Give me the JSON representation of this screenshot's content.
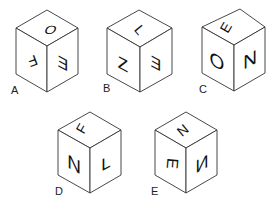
{
  "cubes": [
    {
      "label": "A",
      "faces": {
        "top": "O",
        "left": "F",
        "right": "E"
      },
      "notes": {
        "top": "upright",
        "left": "rotated ~180 (upside-down)",
        "right": "mirrored"
      }
    },
    {
      "label": "B",
      "faces": {
        "top": "L",
        "left": "Z",
        "right": "E"
      },
      "notes": {
        "top": "rotated",
        "left": "upright",
        "right": "mirrored"
      }
    },
    {
      "label": "C",
      "faces": {
        "top": "E",
        "left": "O",
        "right": "N"
      },
      "notes": {
        "top": "rotated",
        "left": "upright",
        "right": "upright"
      }
    },
    {
      "label": "D",
      "faces": {
        "top": "F",
        "left": "N",
        "right": "L"
      },
      "notes": {
        "top": "rotated",
        "left": "upright",
        "right": "upright"
      }
    },
    {
      "label": "E",
      "faces": {
        "top": "N",
        "left": "E",
        "right": "N"
      },
      "notes": {
        "top": "rotated",
        "left": "rotated 90",
        "right": "mirrored"
      }
    }
  ],
  "colors": {
    "line": "#333333",
    "glyph": "#111111",
    "background": "#ffffff"
  }
}
